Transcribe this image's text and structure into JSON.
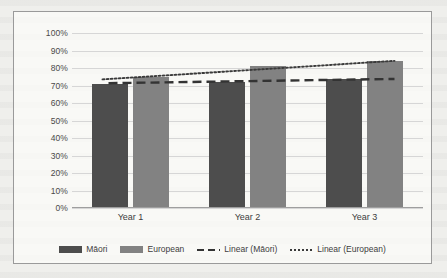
{
  "chart_data": {
    "type": "bar",
    "title": "",
    "xlabel": "",
    "ylabel": "",
    "categories": [
      "Year 1",
      "Year 2",
      "Year 3"
    ],
    "ylim": [
      0,
      100
    ],
    "ytick_labels": [
      "100%",
      "90%",
      "80%",
      "70%",
      "60%",
      "50%",
      "40%",
      "30%",
      "20%",
      "10%",
      "0%"
    ],
    "ytick_values": [
      100,
      90,
      80,
      70,
      60,
      50,
      40,
      30,
      20,
      10,
      0
    ],
    "grid": true,
    "legend_position": "bottom",
    "series": [
      {
        "name": "Māori",
        "type": "bar",
        "color": "#4d4d4d",
        "values": [
          71,
          72,
          74
        ]
      },
      {
        "name": "European",
        "type": "bar",
        "color": "#828282",
        "values": [
          75,
          81,
          84
        ]
      },
      {
        "name": "Linear (Māori)",
        "type": "trendline",
        "style": "dashed",
        "color": "#333333",
        "values": [
          71.5,
          72.5,
          73.5
        ]
      },
      {
        "name": "Linear (European)",
        "type": "trendline",
        "style": "dotted",
        "color": "#3a3a3a",
        "values": [
          74.5,
          78.8,
          83.0
        ]
      }
    ]
  },
  "legend": {
    "items": [
      {
        "label": "Māori",
        "marker": "swatch-dark"
      },
      {
        "label": "European",
        "marker": "swatch-gray"
      },
      {
        "label": "Linear (Māori)",
        "marker": "dashed-line"
      },
      {
        "label": "Linear (European)",
        "marker": "dotted-line"
      }
    ]
  },
  "colors": {
    "maori_bar": "#4d4d4d",
    "european_bar": "#828282",
    "gridline": "#d6d6d6",
    "frame_border": "#9a9a9a",
    "page_background": "#efefec"
  }
}
